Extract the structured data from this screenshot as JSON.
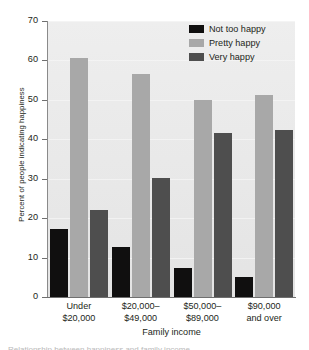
{
  "chart_data": {
    "type": "bar",
    "title": "",
    "subtitle": "",
    "xlabel": "Family income",
    "ylabel": "Percent of people indicating happiness",
    "ylim": [
      0,
      70
    ],
    "yticks": [
      0,
      10,
      20,
      30,
      40,
      50,
      60,
      70
    ],
    "grid": true,
    "legend_position": "top-right",
    "categories": [
      "Under\n$20,000",
      "$20,000–\n$49,000",
      "$50,000–\n$89,000",
      "$90,000\nand over"
    ],
    "category_lines": [
      [
        "Under",
        "$20,000"
      ],
      [
        "$20,000–",
        "$49,000"
      ],
      [
        "$50,000–",
        "$89,000"
      ],
      [
        "$90,000",
        "and over"
      ]
    ],
    "series": [
      {
        "name": "Not too happy",
        "color": "#100f0f",
        "values": [
          17.3,
          12.8,
          7.4,
          5.1
        ]
      },
      {
        "name": "Pretty happy",
        "color": "#a8a8a8",
        "values": [
          60.5,
          56.5,
          50.0,
          51.3
        ]
      },
      {
        "name": "Very happy",
        "color": "#4e4e4e",
        "values": [
          22.1,
          30.1,
          41.5,
          42.4
        ]
      }
    ]
  },
  "legend": {
    "items": [
      {
        "label": "Not too happy",
        "color": "#100f0f"
      },
      {
        "label": "Pretty happy",
        "color": "#a8a8a8"
      },
      {
        "label": "Very happy",
        "color": "#4e4e4e"
      }
    ]
  },
  "axes": {
    "y_title": "Percent of people indicating happiness",
    "x_title": "Family income",
    "y_tick_labels": [
      "70",
      "60",
      "50",
      "40",
      "30",
      "20",
      "10",
      "0"
    ]
  },
  "caption_sliver": "Relationship between happiness and family income"
}
